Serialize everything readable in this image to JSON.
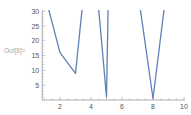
{
  "cell": {
    "output_label": "Out[8]="
  },
  "chart_data": {
    "type": "line",
    "title": "",
    "xlabel": "",
    "ylabel": "",
    "x": [
      1,
      2,
      3,
      4,
      5,
      6,
      7,
      8,
      9
    ],
    "values": [
      36,
      16,
      9,
      60,
      1,
      290,
      37.4,
      0.5,
      42.6
    ],
    "series": [
      {
        "name": "data",
        "values": [
          36,
          16,
          9,
          60,
          1,
          290,
          37.4,
          0.5,
          42.6
        ],
        "color": "#5E81B5"
      }
    ],
    "xlim": [
      0.85,
      10
    ],
    "ylim": [
      0,
      30
    ],
    "xticks": [
      2,
      4,
      6,
      8,
      10
    ],
    "yticks": [
      5,
      10,
      15,
      20,
      25,
      30
    ],
    "grid": false,
    "legend": "none"
  },
  "axes": {
    "xtick_labels": [
      "2",
      "4",
      "6",
      "8",
      "10"
    ],
    "ytick_labels": [
      "5",
      "10",
      "15",
      "20",
      "25",
      "30"
    ]
  },
  "colors": {
    "line": "#5E81B5",
    "axis": "#999999",
    "label": "#555555"
  }
}
